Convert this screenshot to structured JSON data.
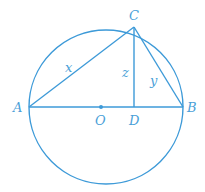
{
  "diagram": {
    "type": "geometry",
    "color": "#3d9ad8",
    "circle": {
      "center": "O",
      "cx": 106,
      "cy": 107,
      "r": 77
    },
    "points": {
      "A": {
        "label": "A",
        "x": 29,
        "y": 107
      },
      "B": {
        "label": "B",
        "x": 183,
        "y": 107
      },
      "C": {
        "label": "C",
        "x": 134,
        "y": 27
      },
      "D": {
        "label": "D",
        "x": 134,
        "y": 107
      },
      "O": {
        "label": "O",
        "x": 101,
        "y": 107
      }
    },
    "segments": [
      {
        "from": "A",
        "to": "B",
        "label": ""
      },
      {
        "from": "A",
        "to": "C",
        "label": "x"
      },
      {
        "from": "C",
        "to": "B",
        "label": "y"
      },
      {
        "from": "C",
        "to": "D",
        "label": "z"
      }
    ],
    "segment_labels": {
      "x": "x",
      "y": "y",
      "z": "z"
    }
  }
}
